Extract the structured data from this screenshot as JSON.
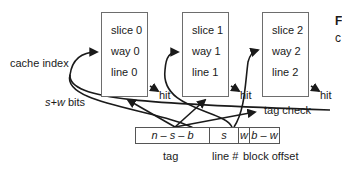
{
  "diagram": {
    "ways": [
      {
        "slice": "slice 0",
        "way": "way 0",
        "line": "line 0",
        "hit": "hit"
      },
      {
        "slice": "slice 1",
        "way": "way 1",
        "line": "line 1",
        "hit": "hit"
      },
      {
        "slice": "slice 2",
        "way": "way 2",
        "line": "line 2",
        "hit": "hit"
      }
    ],
    "labels": {
      "cache_index": "cache index",
      "s_w_bits_var": "s+w",
      "s_w_bits_suffix": " bits",
      "tag_check": "tag check"
    },
    "address_fields": [
      {
        "text": "n – s – b",
        "label": "tag"
      },
      {
        "text": "s",
        "label": "line #"
      },
      {
        "text": "w",
        "label": ""
      },
      {
        "text": "b – w",
        "label": "block offset"
      }
    ],
    "cut_off_text": {
      "top_right_1": "F",
      "top_right_2": "c"
    },
    "colors": {
      "stroke": "#1a1a1a",
      "box_border": "#6d6d6d",
      "background": "#ffffff"
    }
  }
}
